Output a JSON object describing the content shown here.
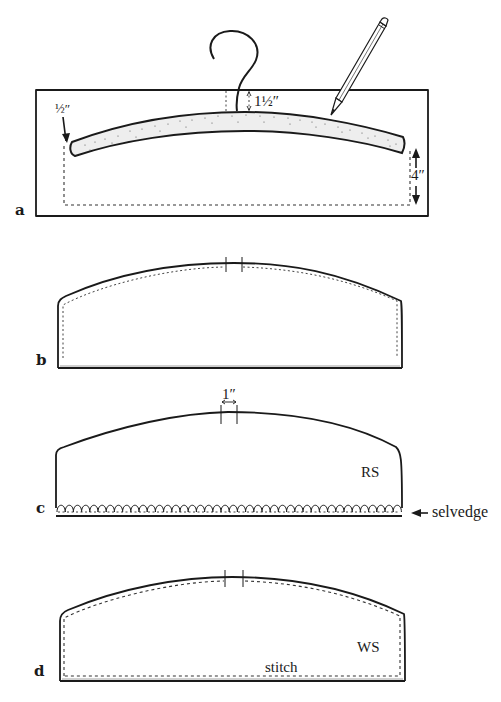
{
  "figure": {
    "panels": [
      {
        "id": "a",
        "label": "a",
        "annotations": {
          "seam_allowance": "½″",
          "hook_offset": "1½″",
          "depth": "4″"
        }
      },
      {
        "id": "b",
        "label": "b"
      },
      {
        "id": "c",
        "label": "c",
        "annotations": {
          "opening_width": "1″",
          "side": "RS",
          "edge": "selvedge"
        }
      },
      {
        "id": "d",
        "label": "d",
        "annotations": {
          "side": "WS",
          "instruction": "stitch"
        }
      }
    ],
    "colors": {
      "ink": "#1a1a1a",
      "hanger_fill": "#eeeeee",
      "background": "#ffffff"
    }
  }
}
